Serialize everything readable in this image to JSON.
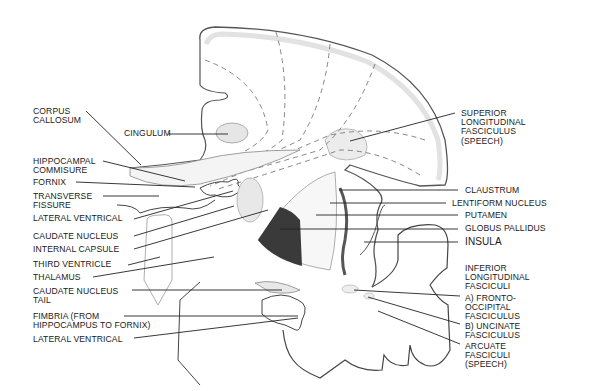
{
  "diagram": {
    "colors": {
      "ink": "#1a1a1a",
      "outline": "#555555",
      "cortex_shade": "#d9d9d9",
      "globus_pallidus": "#3a3a3a"
    }
  },
  "labels": {
    "left": [
      {
        "id": "corpus-callosum",
        "text": "CORPUS\nCALLOSUM",
        "x": 33,
        "y": 107
      },
      {
        "id": "cingulum",
        "text": "CINGULUM",
        "x": 124,
        "y": 131
      },
      {
        "id": "hippocampal-commisure",
        "text": "HIPPOCAMPAL\nCOMMISURE",
        "x": 33,
        "y": 157
      },
      {
        "id": "fornix",
        "text": "FORNIX",
        "x": 33,
        "y": 178
      },
      {
        "id": "transverse-fissure",
        "text": "TRANSVERSE\nFISSURE",
        "x": 33,
        "y": 192
      },
      {
        "id": "lateral-ventrical-upper",
        "text": "LATERAL VENTRICAL",
        "x": 33,
        "y": 215
      },
      {
        "id": "caudate-nucleus",
        "text": "CAUDATE NUCLEUS",
        "x": 33,
        "y": 233
      },
      {
        "id": "internal-capsule",
        "text": "INTERNAL CAPSULE",
        "x": 33,
        "y": 247
      },
      {
        "id": "third-ventricle",
        "text": "THIRD VENTRICLE",
        "x": 33,
        "y": 261
      },
      {
        "id": "thalamus",
        "text": "THALAMUS",
        "x": 33,
        "y": 273
      },
      {
        "id": "caudate-nucleus-tail",
        "text": "CAUDATE NUCLEUS\nTAIL",
        "x": 33,
        "y": 287
      },
      {
        "id": "fimbria",
        "text": "FIMBRIA (FROM\nHIPPOCAMPUS TO FORNIX)",
        "x": 33,
        "y": 312
      },
      {
        "id": "lateral-ventrical-lower",
        "text": "LATERAL VENTRICAL",
        "x": 33,
        "y": 335
      }
    ],
    "right": [
      {
        "id": "superior-longitudinal-fasciculus",
        "text": "SUPERIOR\nLONGITUDINAL\nFASCICULUS\n(SPEECH)",
        "x": 461,
        "y": 109
      },
      {
        "id": "claustrum",
        "text": "CLAUSTRUM",
        "x": 465,
        "y": 186
      },
      {
        "id": "lentiform-nucleus",
        "text": "LENTIFORM NUCLEUS",
        "x": 452,
        "y": 199
      },
      {
        "id": "putamen",
        "text": "PUTAMEN",
        "x": 465,
        "y": 212
      },
      {
        "id": "globus-pallidus",
        "text": "GLOBUS PALLIDUS",
        "x": 465,
        "y": 224
      },
      {
        "id": "insula",
        "text": "INSULA",
        "x": 465,
        "y": 237
      },
      {
        "id": "inferior-longitudinal-fasciculi",
        "text": "INFERIOR\nLONGITUDINAL\nFASCICULI",
        "x": 465,
        "y": 263
      },
      {
        "id": "fronto-occipital-fasciculus",
        "text": "A) FRONTO-\nOCCIPITAL\nFASCICULUS",
        "x": 465,
        "y": 294
      },
      {
        "id": "uncinate-fasciculus",
        "text": "B) UNCINATE\nFASCICULUS",
        "x": 465,
        "y": 322
      },
      {
        "id": "arcuate-fasciculi",
        "text": "ARCUATE\nFASCICULI\n(SPEECH)",
        "x": 465,
        "y": 341
      }
    ]
  }
}
